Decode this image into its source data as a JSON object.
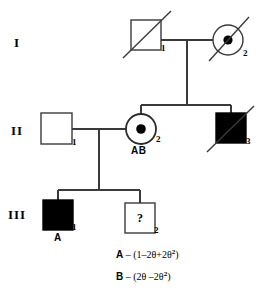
{
  "diagram": {
    "type": "pedigree-chart",
    "line_color": "#2b2b2b",
    "fill_affected": "#000000",
    "fill_unaffected": "#ffffff",
    "generations": [
      {
        "id": "I",
        "label": "I"
      },
      {
        "id": "II",
        "label": "II"
      },
      {
        "id": "III",
        "label": "III"
      }
    ],
    "individuals": [
      {
        "id": "I-1",
        "number": "1",
        "sex": "male",
        "shape": "square",
        "affected": false,
        "carrier": false,
        "deceased": true,
        "tag": ""
      },
      {
        "id": "I-2",
        "number": "2",
        "sex": "female",
        "shape": "circle",
        "affected": false,
        "carrier": true,
        "deceased": true,
        "tag": ""
      },
      {
        "id": "II-1",
        "number": "1",
        "sex": "male",
        "shape": "square",
        "affected": false,
        "carrier": false,
        "deceased": false,
        "tag": ""
      },
      {
        "id": "II-2",
        "number": "2",
        "sex": "female",
        "shape": "circle",
        "affected": false,
        "carrier": true,
        "deceased": false,
        "tag": "AB"
      },
      {
        "id": "II-3",
        "number": "3",
        "sex": "male",
        "shape": "square",
        "affected": true,
        "carrier": false,
        "deceased": true,
        "tag": ""
      },
      {
        "id": "III-1",
        "number": "1",
        "sex": "male",
        "shape": "square",
        "affected": true,
        "carrier": false,
        "deceased": false,
        "tag": "A"
      },
      {
        "id": "III-2",
        "number": "2",
        "sex": "male",
        "shape": "square",
        "affected": false,
        "carrier": false,
        "deceased": false,
        "tag": "",
        "unknown_mark": "?"
      }
    ]
  },
  "legend": {
    "rows": [
      {
        "key": "A",
        "dash": "–",
        "expr_open": "(1–2θ+2θ",
        "exponent": "2",
        "expr_close": ")"
      },
      {
        "key": "B",
        "dash": "–",
        "expr_open": "(2θ –2θ",
        "exponent": "2",
        "expr_close": ")"
      }
    ]
  }
}
